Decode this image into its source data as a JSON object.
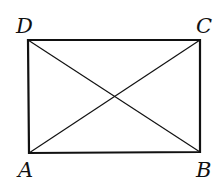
{
  "diagram": {
    "type": "geometry",
    "shape": "rectangle with diagonals",
    "vertices": [
      {
        "label": "D",
        "x": 28,
        "y": 40
      },
      {
        "label": "C",
        "x": 200,
        "y": 40
      },
      {
        "label": "B",
        "x": 200,
        "y": 152
      },
      {
        "label": "A",
        "x": 29,
        "y": 153
      }
    ],
    "labels": {
      "A": "A",
      "B": "B",
      "C": "C",
      "D": "D"
    },
    "edges": [
      "AB",
      "BC",
      "CD",
      "DA"
    ],
    "diagonals": [
      "AC",
      "BD"
    ],
    "stroke_color": "#111111"
  }
}
